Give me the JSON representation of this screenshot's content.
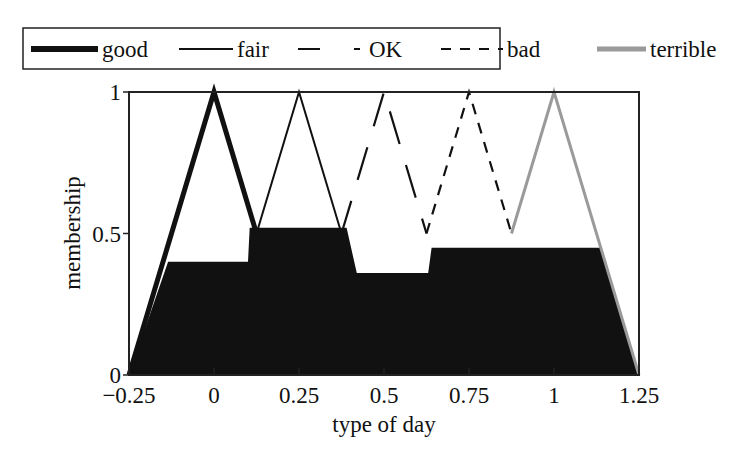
{
  "chart_data": {
    "type": "area",
    "title": "",
    "xlabel": "type of day",
    "ylabel": "membership",
    "xlim": [
      -0.25,
      1.25
    ],
    "ylim": [
      0,
      1
    ],
    "x_ticks": [
      "-0.25",
      "0",
      "0.25",
      "0.5",
      "0.75",
      "1",
      "1.25"
    ],
    "x_tick_values": [
      -0.25,
      0,
      0.25,
      0.5,
      0.75,
      1,
      1.25
    ],
    "y_ticks": [
      "0",
      "0.5",
      "1"
    ],
    "y_tick_values": [
      0,
      0.5,
      1
    ],
    "grid": false,
    "legend_position": "top",
    "series": [
      {
        "name": "good",
        "style": "thick-solid",
        "color": "#111111",
        "x": [
          -0.25,
          0,
          0.125
        ],
        "y": [
          0,
          1,
          0.5
        ]
      },
      {
        "name": "fair",
        "style": "solid",
        "color": "#111111",
        "x": [
          0.125,
          0.25,
          0.375
        ],
        "y": [
          0.5,
          1,
          0.5
        ]
      },
      {
        "name": "OK",
        "style": "long-dash",
        "color": "#111111",
        "x": [
          0.375,
          0.5,
          0.625
        ],
        "y": [
          0.5,
          1,
          0.5
        ]
      },
      {
        "name": "bad",
        "style": "short-dash",
        "color": "#111111",
        "x": [
          0.625,
          0.75,
          0.875
        ],
        "y": [
          0.5,
          1,
          0.5
        ]
      },
      {
        "name": "terrible",
        "style": "thick-gray",
        "color": "#999999",
        "x": [
          0.875,
          1,
          1.25
        ],
        "y": [
          0.5,
          1,
          0
        ]
      }
    ],
    "aggregated_output": {
      "color": "#111111",
      "x": [
        -0.25,
        -0.135,
        0.1,
        0.105,
        0.125,
        0.39,
        0.42,
        0.63,
        0.64,
        1.14,
        1.25
      ],
      "y": [
        0,
        0.4,
        0.4,
        0.52,
        0.52,
        0.52,
        0.36,
        0.36,
        0.45,
        0.45,
        0
      ],
      "plateaus": {
        "good": 0.4,
        "fair": 0.52,
        "OK": 0.36,
        "bad": 0.45,
        "terrible": 0.45
      }
    }
  },
  "legend": {
    "items": [
      {
        "label": "good"
      },
      {
        "label": "fair"
      },
      {
        "label": "OK"
      },
      {
        "label": "bad"
      },
      {
        "label": "terrible"
      }
    ]
  }
}
